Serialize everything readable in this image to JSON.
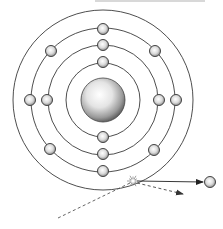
{
  "diagram": {
    "title": "",
    "type": "bohr-atom-photoelectric-ionization",
    "colors": {
      "background": "#ffffff",
      "orbit_stroke": "#3a3a3a",
      "electron_fill": "#d8d8d8",
      "electron_stroke": "#444444",
      "nucleus_highlight": "#ffffff",
      "nucleus_shadow": "#555555",
      "arrow": "#222222",
      "dashed": "#555555",
      "top_bar": "#d0d0d0"
    },
    "center": [
      103,
      100
    ],
    "nucleus": {
      "radius": 22
    },
    "orbits": [
      {
        "radius": 37,
        "electrons": 2
      },
      {
        "radius": 55,
        "electrons": 4
      },
      {
        "radius": 72,
        "electrons": 8
      },
      {
        "radius": 90,
        "electrons": 0
      }
    ],
    "electrons": [
      {
        "shell": 1,
        "x": 103,
        "y": 62
      },
      {
        "shell": 1,
        "x": 103,
        "y": 137
      },
      {
        "shell": 2,
        "x": 103,
        "y": 45
      },
      {
        "shell": 2,
        "x": 103,
        "y": 154
      },
      {
        "shell": 2,
        "x": 47,
        "y": 100
      },
      {
        "shell": 2,
        "x": 159,
        "y": 100
      },
      {
        "shell": 3,
        "x": 103,
        "y": 29
      },
      {
        "shell": 3,
        "x": 103,
        "y": 171
      },
      {
        "shell": 3,
        "x": 30,
        "y": 100
      },
      {
        "shell": 3,
        "x": 176,
        "y": 100
      },
      {
        "shell": 3,
        "x": 51,
        "y": 51
      },
      {
        "shell": 3,
        "x": 155,
        "y": 51
      },
      {
        "shell": 3,
        "x": 50,
        "y": 149
      },
      {
        "shell": 3,
        "x": 154,
        "y": 150
      }
    ],
    "collision": {
      "x": 133,
      "y": 181,
      "label": ""
    },
    "ejected_electron": {
      "x": 210,
      "y": 182
    },
    "arrows": {
      "ejected_path": {
        "from": [
          137,
          181
        ],
        "to": [
          203,
          182
        ],
        "style": "solid"
      },
      "incoming_photon": {
        "from": [
          58,
          218
        ],
        "to": [
          130,
          183
        ],
        "style": "dashed"
      },
      "scattered_photon": {
        "from": [
          137,
          183
        ],
        "to": [
          183,
          194
        ],
        "style": "dashed"
      }
    }
  }
}
